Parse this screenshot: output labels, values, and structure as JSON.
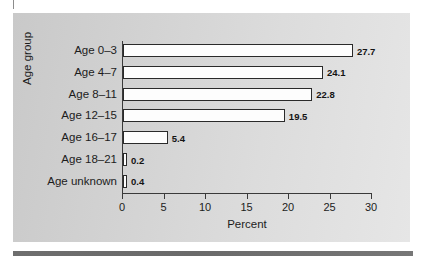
{
  "chart_data": {
    "type": "bar",
    "orientation": "horizontal",
    "title": "",
    "xlabel": "Percent",
    "ylabel": "Age group",
    "categories": [
      "Age 0–3",
      "Age 4–7",
      "Age 8–11",
      "Age 12–15",
      "Age 16–17",
      "Age 18–21",
      "Age unknown"
    ],
    "values": [
      27.7,
      24.1,
      22.8,
      19.5,
      5.4,
      0.2,
      0.4
    ],
    "value_labels": [
      "27.7",
      "24.1",
      "22.8",
      "19.5",
      "5.4",
      "0.2",
      "0.4"
    ],
    "xlim": [
      0,
      30
    ],
    "xticks": [
      0,
      5,
      10,
      15,
      20,
      25,
      30
    ],
    "xtick_labels": [
      "0",
      "5",
      "10",
      "15",
      "20",
      "25",
      "30"
    ],
    "grid": false,
    "legend": null,
    "bar_fill_color": "#fdfdfd",
    "bar_edge_color": "#2a2a2a",
    "panel_background_color": "#d5d5d5",
    "axis_color": "#3a3a3a",
    "text_color": "#1c1c1c"
  }
}
